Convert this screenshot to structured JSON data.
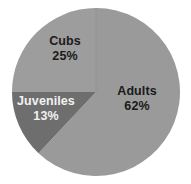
{
  "chart_data": {
    "type": "pie",
    "title": "",
    "subtitle": "",
    "xlabel": "",
    "ylabel": "",
    "legend_position": "none",
    "grid": false,
    "labels_inside": true,
    "categories": [
      "Adults",
      "Cubs",
      "Juveniles"
    ],
    "values": [
      62,
      25,
      13
    ],
    "unit": "%",
    "slices": [
      {
        "name": "Adults",
        "label": "Adults",
        "value": 62,
        "value_label": "62%",
        "color": "#9a9a9a",
        "text_color": "#1b1b1b",
        "start_angle_deg": 0,
        "end_angle_deg": 223.2
      },
      {
        "name": "Cubs",
        "label": "Cubs",
        "value": 25,
        "value_label": "25%",
        "color": "#9d9d9d",
        "text_color": "#1b1b1b",
        "start_angle_deg": 270,
        "end_angle_deg": 360
      },
      {
        "name": "Juveniles",
        "label": "Juveniles",
        "value": 13,
        "value_label": "13%",
        "color": "#6e6e6e",
        "text_color": "#f2f2f2",
        "start_angle_deg": 223.2,
        "end_angle_deg": 270
      }
    ]
  },
  "style": {
    "background": "#ffffff",
    "pie_center_x": 96,
    "pie_center_y": 92,
    "pie_radius": 84,
    "divider_color": "#8d8d8d"
  }
}
